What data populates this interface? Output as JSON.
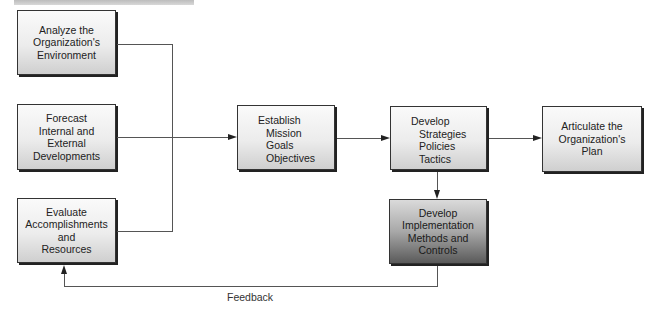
{
  "diagram": {
    "nodes": [
      {
        "id": "analyze",
        "lines": [
          "Analyze the",
          "Organization's",
          "Environment"
        ]
      },
      {
        "id": "forecast",
        "lines": [
          "Forecast",
          "Internal and",
          "External",
          "Developments"
        ]
      },
      {
        "id": "evaluate",
        "lines": [
          "Evaluate",
          "Accomplishments",
          "and",
          "Resources"
        ]
      },
      {
        "id": "establish",
        "title": "Establish",
        "items": [
          "Mission",
          "Goals",
          "Objectives"
        ]
      },
      {
        "id": "develop-strategies",
        "title": "Develop",
        "items": [
          "Strategies",
          "Policies",
          "Tactics"
        ]
      },
      {
        "id": "articulate",
        "lines": [
          "Articulate the",
          "Organization's",
          "Plan"
        ]
      },
      {
        "id": "implementation",
        "lines": [
          "Develop",
          "Implementation",
          "Methods and",
          "Controls"
        ]
      }
    ],
    "edges": [
      {
        "from": "analyze",
        "to": "establish"
      },
      {
        "from": "forecast",
        "to": "establish"
      },
      {
        "from": "evaluate",
        "to": "establish"
      },
      {
        "from": "establish",
        "to": "develop-strategies"
      },
      {
        "from": "develop-strategies",
        "to": "articulate"
      },
      {
        "from": "develop-strategies",
        "to": "implementation"
      },
      {
        "from": "implementation",
        "to": "evaluate",
        "label": "Feedback"
      }
    ],
    "feedback_label": "Feedback"
  }
}
